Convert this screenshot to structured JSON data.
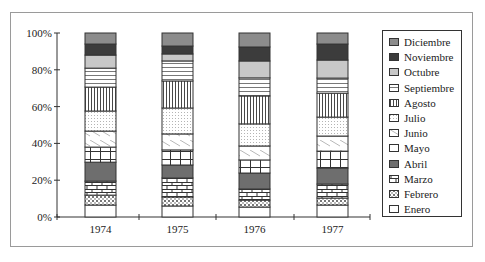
{
  "chart_data": {
    "type": "bar",
    "stacked": true,
    "percent_stacked": true,
    "title": "",
    "xlabel": "",
    "ylabel": "",
    "categories": [
      "1974",
      "1975",
      "1976",
      "1977"
    ],
    "ylim": [
      0,
      100
    ],
    "yticks": [
      "0%",
      "20%",
      "40%",
      "60%",
      "80%",
      "100%"
    ],
    "grid": false,
    "legend_position": "right",
    "series": [
      {
        "name": "Enero",
        "pattern": "blank",
        "values": [
          6.5,
          6.0,
          5.4,
          6.5
        ]
      },
      {
        "name": "Febrero",
        "pattern": "dotted-brick",
        "values": [
          5.4,
          4.9,
          3.8,
          3.8
        ]
      },
      {
        "name": "Marzo",
        "pattern": "brick",
        "values": [
          7.6,
          10.3,
          6.0,
          7.6
        ]
      },
      {
        "name": "Abril",
        "pattern": "dark-gray",
        "values": [
          10.3,
          7.1,
          8.7,
          8.7
        ]
      },
      {
        "name": "Mayo",
        "pattern": "grid",
        "values": [
          8.2,
          8.2,
          7.1,
          9.2
        ]
      },
      {
        "name": "Junio",
        "pattern": "diagonal",
        "values": [
          8.7,
          8.7,
          7.6,
          8.2
        ]
      },
      {
        "name": "Julio",
        "pattern": "dots",
        "values": [
          10.9,
          14.1,
          12.0,
          10.3
        ]
      },
      {
        "name": "Agosto",
        "pattern": "vertical",
        "values": [
          13.0,
          14.7,
          15.2,
          13.0
        ]
      },
      {
        "name": "Septiembre",
        "pattern": "horizontal",
        "values": [
          10.3,
          10.9,
          9.8,
          8.2
        ]
      },
      {
        "name": "Octubre",
        "pattern": "light-gray",
        "values": [
          7.1,
          3.8,
          9.2,
          9.8
        ]
      },
      {
        "name": "Noviembre",
        "pattern": "darkest-gray",
        "values": [
          6.0,
          4.3,
          7.6,
          8.7
        ]
      },
      {
        "name": "Diciembre",
        "pattern": "mid-gray",
        "values": [
          6.0,
          7.1,
          7.6,
          6.0
        ]
      }
    ],
    "legend_order": [
      "Diciembre",
      "Noviembre",
      "Octubre",
      "Septiembre",
      "Agosto",
      "Julio",
      "Junio",
      "Mayo",
      "Abril",
      "Marzo",
      "Febrero",
      "Enero"
    ]
  },
  "colors": {
    "mid-gray": "#8c8c8c",
    "darkest-gray": "#3c3c3c",
    "light-gray": "#c8c8c8",
    "dark-gray": "#6e6e6e",
    "stroke": "#333333"
  }
}
